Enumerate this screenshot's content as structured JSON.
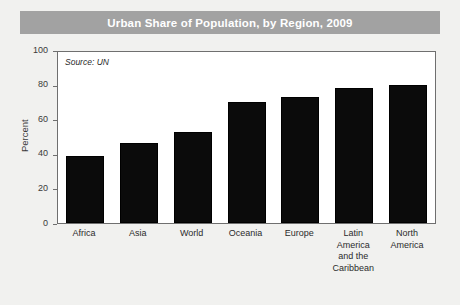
{
  "figure": {
    "title": "Urban Share of Population, by Region, 2009",
    "source_note": "Source: UN",
    "title_bar_color": "#a2a2a2",
    "title_text_color": "#ffffff",
    "bar_color": "#0b0b0b",
    "plot_background": "#ffffff",
    "page_background": "#f1f1ef"
  },
  "chart_data": {
    "type": "bar",
    "title": "Urban Share of Population, by Region, 2009",
    "xlabel": "",
    "ylabel": "Percent",
    "ylim": [
      0,
      100
    ],
    "yticks": [
      0,
      20,
      40,
      60,
      80,
      100
    ],
    "ytick_labels": [
      "0",
      "20",
      "40",
      "60",
      "80",
      "100"
    ],
    "grid": false,
    "legend": "none",
    "annotations": [
      "Source: UN"
    ],
    "categories": [
      "Africa",
      "Asia",
      "World",
      "Oceania",
      "Europe",
      "Latin America and the Caribbean",
      "North America"
    ],
    "category_labels": [
      "Africa",
      "Asia",
      "World",
      "Oceania",
      "Europe",
      "Latin\nAmerica\nand the\nCaribbean",
      "North\nAmerica"
    ],
    "values": [
      39,
      47,
      53,
      70.5,
      73.5,
      79,
      81
    ]
  }
}
